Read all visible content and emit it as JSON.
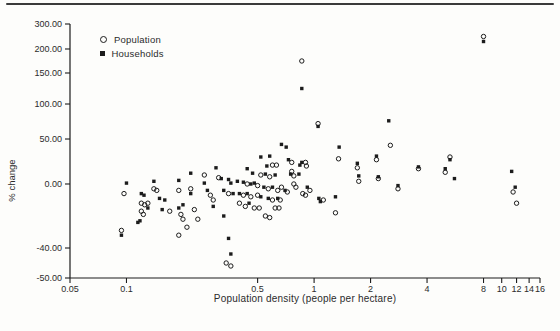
{
  "chart_data": {
    "type": "scatter",
    "title": "",
    "xlabel": "Population density (people per hectare)",
    "ylabel": "% change",
    "x_scale": "log",
    "xlim": [
      0.05,
      16
    ],
    "x_ticks": [
      0.05,
      0.1,
      0.5,
      1,
      2,
      4,
      8,
      10,
      12,
      14,
      16
    ],
    "x_tick_labels": [
      "0.05",
      "0.1",
      "0.5",
      "1",
      "2",
      "4",
      "8",
      "10",
      "12",
      "14",
      "16"
    ],
    "y_ticks": [
      300,
      200,
      150,
      100,
      50,
      0,
      -40,
      -50
    ],
    "y_tick_labels": [
      "300.00",
      "200.00",
      "150.00",
      "100.00",
      "50.00",
      "0.00",
      "-40.00",
      "-50.00"
    ],
    "y_scale_note": "irregular axis - intervals compressed toward top as labeled",
    "grid": false,
    "legend_position": "upper-left-inside",
    "colors": {
      "ink": "#1c1c1c",
      "paper": "#fdfdfb"
    },
    "legend": [
      {
        "name": "Population",
        "marker": "open-circle"
      },
      {
        "name": "Households",
        "marker": "filled-square"
      }
    ],
    "series": [
      {
        "name": "Population",
        "marker": "open-circle",
        "points": [
          [
            0.094,
            -29
          ],
          [
            0.097,
            -6
          ],
          [
            0.12,
            -12
          ],
          [
            0.12,
            -17
          ],
          [
            0.125,
            -13
          ],
          [
            0.123,
            -19
          ],
          [
            0.14,
            -3
          ],
          [
            0.145,
            -4
          ],
          [
            0.13,
            -12
          ],
          [
            0.17,
            -17
          ],
          [
            0.19,
            -4
          ],
          [
            0.19,
            -32
          ],
          [
            0.195,
            -19
          ],
          [
            0.2,
            -22
          ],
          [
            0.21,
            -27
          ],
          [
            0.22,
            -3
          ],
          [
            0.23,
            -16
          ],
          [
            0.24,
            -22
          ],
          [
            0.26,
            10
          ],
          [
            0.28,
            -7
          ],
          [
            0.29,
            -10
          ],
          [
            0.31,
            7
          ],
          [
            0.34,
            -45
          ],
          [
            0.36,
            -46
          ],
          [
            0.35,
            -6
          ],
          [
            0.4,
            -12
          ],
          [
            0.42,
            -7
          ],
          [
            0.43,
            -14
          ],
          [
            0.44,
            0
          ],
          [
            0.46,
            -8
          ],
          [
            0.48,
            -15
          ],
          [
            0.5,
            -1
          ],
          [
            0.5,
            -7
          ],
          [
            0.51,
            -15
          ],
          [
            0.52,
            10
          ],
          [
            0.55,
            -20
          ],
          [
            0.57,
            -3
          ],
          [
            0.58,
            8
          ],
          [
            0.58,
            -21
          ],
          [
            0.6,
            21
          ],
          [
            0.6,
            -10
          ],
          [
            0.63,
            21
          ],
          [
            0.64,
            -4
          ],
          [
            0.62,
            -15
          ],
          [
            0.65,
            -15
          ],
          [
            0.66,
            -10
          ],
          [
            0.67,
            -2
          ],
          [
            0.72,
            -5
          ],
          [
            0.76,
            24
          ],
          [
            0.76,
            14
          ],
          [
            0.78,
            9
          ],
          [
            0.78,
            0
          ],
          [
            0.8,
            -2
          ],
          [
            0.86,
            175
          ],
          [
            0.87,
            -6
          ],
          [
            0.9,
            24
          ],
          [
            0.9,
            -7
          ],
          [
            0.91,
            20
          ],
          [
            0.95,
            -4
          ],
          [
            1.05,
            72
          ],
          [
            1.12,
            -10
          ],
          [
            1.3,
            -18
          ],
          [
            1.35,
            28
          ],
          [
            1.7,
            18
          ],
          [
            1.73,
            3
          ],
          [
            2.15,
            27
          ],
          [
            2.2,
            6
          ],
          [
            2.55,
            43
          ],
          [
            2.8,
            -3
          ],
          [
            3.6,
            17
          ],
          [
            5.0,
            13
          ],
          [
            5.3,
            30
          ],
          [
            8.0,
            250
          ],
          [
            11.5,
            -5
          ],
          [
            12.0,
            -12
          ]
        ]
      },
      {
        "name": "Households",
        "marker": "filled-square",
        "points": [
          [
            0.094,
            -32
          ],
          [
            0.1,
            1
          ],
          [
            0.115,
            -24
          ],
          [
            0.118,
            -23
          ],
          [
            0.12,
            -6
          ],
          [
            0.124,
            -7
          ],
          [
            0.13,
            -15
          ],
          [
            0.14,
            3
          ],
          [
            0.15,
            -9
          ],
          [
            0.155,
            -16
          ],
          [
            0.16,
            -10
          ],
          [
            0.19,
            4
          ],
          [
            0.19,
            -15
          ],
          [
            0.2,
            -13
          ],
          [
            0.22,
            12
          ],
          [
            0.22,
            -6
          ],
          [
            0.26,
            1
          ],
          [
            0.27,
            -4
          ],
          [
            0.29,
            -14
          ],
          [
            0.3,
            18
          ],
          [
            0.32,
            6
          ],
          [
            0.33,
            -4
          ],
          [
            0.33,
            -20
          ],
          [
            0.35,
            5
          ],
          [
            0.35,
            -34
          ],
          [
            0.36,
            -42
          ],
          [
            0.36,
            1
          ],
          [
            0.37,
            -6
          ],
          [
            0.39,
            3
          ],
          [
            0.4,
            -6
          ],
          [
            0.42,
            2
          ],
          [
            0.44,
            17
          ],
          [
            0.44,
            -6
          ],
          [
            0.45,
            -12
          ],
          [
            0.46,
            0
          ],
          [
            0.47,
            12
          ],
          [
            0.48,
            1
          ],
          [
            0.52,
            30
          ],
          [
            0.52,
            -8
          ],
          [
            0.54,
            -2
          ],
          [
            0.55,
            11
          ],
          [
            0.56,
            20
          ],
          [
            0.57,
            -9
          ],
          [
            0.58,
            31
          ],
          [
            0.6,
            -2
          ],
          [
            0.62,
            10
          ],
          [
            0.64,
            -9
          ],
          [
            0.67,
            44
          ],
          [
            0.7,
            -4
          ],
          [
            0.71,
            41
          ],
          [
            0.73,
            27
          ],
          [
            0.75,
            11
          ],
          [
            0.83,
            11
          ],
          [
            0.84,
            21
          ],
          [
            0.86,
            125
          ],
          [
            0.86,
            24
          ],
          [
            0.92,
            -2
          ],
          [
            1.05,
            68
          ],
          [
            1.06,
            -9
          ],
          [
            1.08,
            -11
          ],
          [
            1.36,
            41
          ],
          [
            1.3,
            -8
          ],
          [
            1.7,
            23
          ],
          [
            1.73,
            9
          ],
          [
            2.15,
            31
          ],
          [
            2.2,
            8
          ],
          [
            2.5,
            76
          ],
          [
            2.8,
            -1
          ],
          [
            3.6,
            19
          ],
          [
            5.0,
            17
          ],
          [
            5.3,
            27
          ],
          [
            5.6,
            6
          ],
          [
            8.0,
            230
          ],
          [
            11.3,
            14
          ],
          [
            11.8,
            -2
          ]
        ]
      }
    ]
  }
}
